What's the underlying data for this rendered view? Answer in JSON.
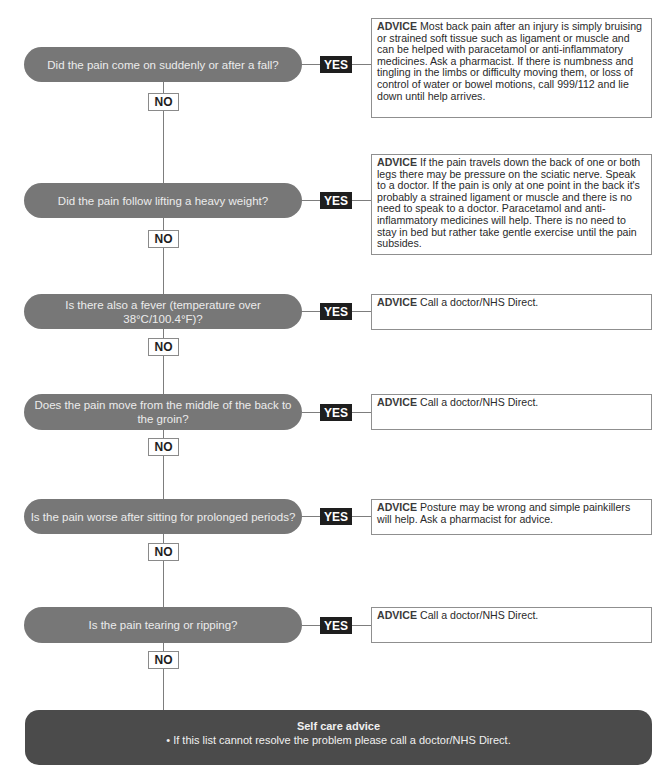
{
  "flowchart": {
    "steps": [
      {
        "question": "Did the pain come on suddenly or after a fall?",
        "yes_label": "YES",
        "no_label": "NO",
        "advice_label": "ADVICE",
        "advice_text": "Most back pain after an injury is simply bruising or strained soft tissue such as ligament or muscle and can be helped with paracetamol or anti-inflammatory medicines. Ask a pharmacist. If there is numbness and tingling in the limbs or difficulty moving them, or loss of control of water or bowel motions, call 999/112 and lie down until help arrives."
      },
      {
        "question": "Did the pain follow lifting a heavy weight?",
        "yes_label": "YES",
        "no_label": "NO",
        "advice_label": "ADVICE",
        "advice_text": "If the pain travels down the back of one or both legs there may be pressure on the sciatic nerve. Speak to a doctor. If the pain is only at one point in the back it's probably a strained ligament or muscle and there is no need to speak to a doctor. Paracetamol and anti-inflammatory medicines will help. There is no need to stay in bed but rather take gentle exercise until the pain subsides."
      },
      {
        "question": "Is there also a fever (temperature over 38°C/100.4°F)?",
        "yes_label": "YES",
        "no_label": "NO",
        "advice_label": "ADVICE",
        "advice_text": "Call a doctor/NHS Direct."
      },
      {
        "question": "Does the pain move from the middle of the back to the groin?",
        "yes_label": "YES",
        "no_label": "NO",
        "advice_label": "ADVICE",
        "advice_text": "Call a doctor/NHS Direct."
      },
      {
        "question": "Is the pain worse after sitting for prolonged periods?",
        "yes_label": "YES",
        "no_label": "NO",
        "advice_label": "ADVICE",
        "advice_text": "Posture may be wrong and simple painkillers will help. Ask a pharmacist for advice."
      },
      {
        "question": "Is the pain tearing or ripping?",
        "yes_label": "YES",
        "no_label": "NO",
        "advice_label": "ADVICE",
        "advice_text": "Call a doctor/NHS Direct."
      }
    ],
    "self_care": {
      "title": "Self care advice",
      "bullet": "• If this list cannot resolve the problem please call a doctor/NHS Direct."
    }
  },
  "colors": {
    "question_pill": "#777777",
    "yes_box": "#1e1e1e",
    "self_care_box": "#4b4b4b",
    "connector": "#7d7d7d"
  }
}
